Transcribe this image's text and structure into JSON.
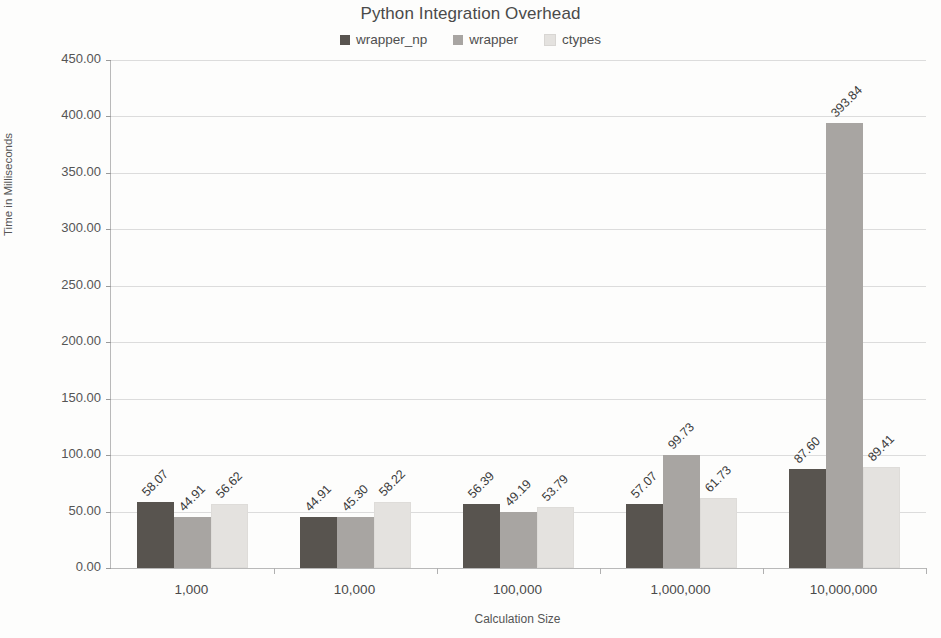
{
  "chart_data": {
    "type": "bar",
    "title": "Python Integration Overhead",
    "xlabel": "Calculation Size",
    "ylabel": "Time in Milliseconds",
    "categories": [
      "1,000",
      "10,000",
      "100,000",
      "1,000,000",
      "10,000,000"
    ],
    "series": [
      {
        "name": "wrapper_np",
        "color": "#58544f",
        "values": [
          58.07,
          44.91,
          56.39,
          57.07,
          87.6
        ],
        "labels": [
          "58.07",
          "44.91",
          "56.39",
          "57.07",
          "87.60"
        ]
      },
      {
        "name": "wrapper",
        "color": "#a8a5a2",
        "values": [
          44.91,
          45.3,
          49.19,
          99.73,
          393.84
        ],
        "labels": [
          "44.91",
          "45.30",
          "49.19",
          "99.73",
          "393.84"
        ]
      },
      {
        "name": "ctypes",
        "color": "#e4e2df",
        "values": [
          56.62,
          58.22,
          53.79,
          61.73,
          89.41
        ],
        "labels": [
          "56.62",
          "58.22",
          "53.79",
          "61.73",
          "89.41"
        ]
      }
    ],
    "ylim": [
      0,
      450
    ],
    "ytick_labels": [
      "450.00",
      "400.00",
      "350.00",
      "300.00",
      "250.00",
      "200.00",
      "150.00",
      "100.00",
      "50.00",
      "0.00"
    ],
    "ytick_values": [
      450,
      400,
      350,
      300,
      250,
      200,
      150,
      100,
      50,
      0
    ],
    "grid": "horizontal",
    "legend_position": "top-center",
    "bar_value_label_rotation": -45
  }
}
